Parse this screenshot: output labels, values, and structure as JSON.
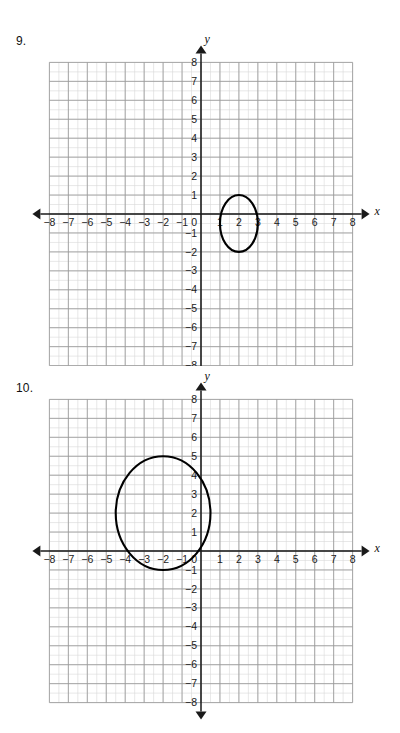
{
  "page": {
    "width": 400,
    "height": 733,
    "background": "#ffffff"
  },
  "colors": {
    "grid_minor": "#d9d9d9",
    "grid_major": "#9a9a9a",
    "axis": "#1a1a1a",
    "curve": "#000000",
    "text": "#111111"
  },
  "problems": [
    {
      "number_label": "9.",
      "axis_labels": {
        "x": "x",
        "y": "y"
      },
      "x_ticks": [
        "−8",
        "−7",
        "−6",
        "−5",
        "−4",
        "−3",
        "−2",
        "−1",
        "1",
        "2",
        "3",
        "4",
        "5",
        "6",
        "7",
        "8"
      ],
      "y_ticks": [
        "8",
        "7",
        "6",
        "5",
        "4",
        "3",
        "2",
        "1",
        "−1",
        "−2",
        "−3",
        "−4",
        "−5",
        "−6",
        "−7",
        "−8"
      ],
      "origin_label": "0",
      "chart_data": {
        "type": "scatter",
        "title": "",
        "xlabel": "x",
        "ylabel": "y",
        "xlim": [
          -8.5,
          8.5
        ],
        "ylim": [
          -8.5,
          8.5
        ],
        "grid": true,
        "curves": [
          {
            "name": "ellipse",
            "shape": "ellipse",
            "center_x": 2,
            "center_y": -0.5,
            "radius_x": 1,
            "radius_y": 1.5
          }
        ]
      }
    },
    {
      "number_label": "10.",
      "axis_labels": {
        "x": "x",
        "y": "y"
      },
      "x_ticks": [
        "−8",
        "−7",
        "−6",
        "−5",
        "−4",
        "−3",
        "−2",
        "−1",
        "1",
        "2",
        "3",
        "4",
        "5",
        "6",
        "7",
        "8"
      ],
      "y_ticks": [
        "8",
        "7",
        "6",
        "5",
        "4",
        "3",
        "2",
        "1",
        "−1",
        "−2",
        "−3",
        "−4",
        "−5",
        "−6",
        "−7",
        "−8"
      ],
      "origin_label": "0",
      "chart_data": {
        "type": "scatter",
        "title": "",
        "xlabel": "x",
        "ylabel": "y",
        "xlim": [
          -8.5,
          8.5
        ],
        "ylim": [
          -8.5,
          8.5
        ],
        "grid": true,
        "curves": [
          {
            "name": "ellipse",
            "shape": "ellipse",
            "center_x": -2,
            "center_y": 2,
            "radius_x": 2.5,
            "radius_y": 3
          }
        ]
      }
    }
  ]
}
